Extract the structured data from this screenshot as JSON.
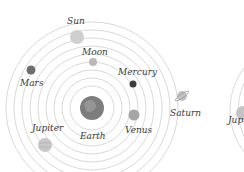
{
  "diagram": {
    "center": {
      "x": 92,
      "y": 108
    },
    "orbit_radii": [
      22,
      30,
      38,
      46,
      54,
      62,
      70,
      78,
      86
    ],
    "orbit_color": "#d9d9d9",
    "bodies": [
      {
        "name": "Earth",
        "label": "Earth",
        "x": 92,
        "y": 108,
        "r": 12,
        "color": "#7d7d7d",
        "label_x": 80,
        "label_y": 139
      },
      {
        "name": "Moon",
        "label": "Moon",
        "x": 93,
        "y": 62,
        "r": 4,
        "color": "#b9b9b9",
        "label_x": 82,
        "label_y": 55
      },
      {
        "name": "Mercury",
        "label": "Mercury",
        "x": 133,
        "y": 84,
        "r": 3.5,
        "color": "#3d3d3d",
        "label_x": 118,
        "label_y": 75
      },
      {
        "name": "Venus",
        "label": "Venus",
        "x": 134,
        "y": 115,
        "r": 5.5,
        "color": "#a6a6a6",
        "label_x": 125,
        "label_y": 133
      },
      {
        "name": "Sun",
        "label": "Sun",
        "x": 77,
        "y": 37,
        "r": 7,
        "color": "#cfcfcf",
        "label_x": 67,
        "label_y": 24
      },
      {
        "name": "Mars",
        "label": "Mars",
        "x": 31,
        "y": 70,
        "r": 4.5,
        "color": "#6e6e6e",
        "label_x": 20,
        "label_y": 86
      },
      {
        "name": "Jupiter",
        "label": "Jupiter",
        "x": 45,
        "y": 145,
        "r": 7,
        "color": "#c8c8c8",
        "label_x": 32,
        "label_y": 131
      },
      {
        "name": "Saturn",
        "label": "Saturn",
        "x": 182,
        "y": 96,
        "r": 5,
        "color": "#c2c2c2",
        "label_x": 170,
        "label_y": 116
      }
    ],
    "secondary": {
      "label": "Jupiter",
      "label_x": 228,
      "label_y": 123,
      "planet": {
        "x": 243,
        "y": 113,
        "r": 7,
        "color": "#c4c4c4"
      },
      "center": {
        "x": 300,
        "y": 110
      },
      "orbit_radii": [
        62,
        70
      ]
    }
  }
}
